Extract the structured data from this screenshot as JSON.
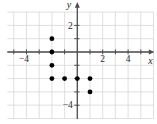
{
  "figure": {
    "background": "#ffffff"
  },
  "chart_data": {
    "type": "scatter",
    "title": "",
    "xlabel": "x",
    "ylabel": "y",
    "points": [
      {
        "x": -2,
        "y": 1
      },
      {
        "x": -2,
        "y": 0
      },
      {
        "x": -2,
        "y": -1
      },
      {
        "x": -2,
        "y": -2
      },
      {
        "x": -1,
        "y": -2
      },
      {
        "x": 0,
        "y": -2
      },
      {
        "x": 1,
        "y": -2
      },
      {
        "x": 1,
        "y": -3
      }
    ],
    "x_axis_tick_values": [
      -5,
      -4,
      -3,
      -2,
      -1,
      1,
      2,
      3,
      4,
      5
    ],
    "y_axis_tick_values": [
      2,
      1,
      -1,
      -2,
      -3,
      -4
    ],
    "x_axis_labeled_ticks": [
      {
        "value": -4,
        "label": "−4"
      },
      {
        "value": 2,
        "label": "2"
      },
      {
        "value": 4,
        "label": "4"
      }
    ],
    "y_axis_labeled_ticks": [
      {
        "value": 2,
        "label": "2"
      },
      {
        "value": -4,
        "label": "−4"
      }
    ],
    "grid": true,
    "grid_x_range": [
      -5,
      6
    ],
    "grid_y_range": [
      -5,
      3
    ],
    "xlim": [
      -5.5,
      6.2
    ],
    "ylim": [
      -5.4,
      3.8
    ],
    "colors": {
      "point": "#000000",
      "axis": "#4d4d4d",
      "grid": "#d8d8d8",
      "label": "#2b2b2b",
      "background": "#ffffff"
    }
  }
}
